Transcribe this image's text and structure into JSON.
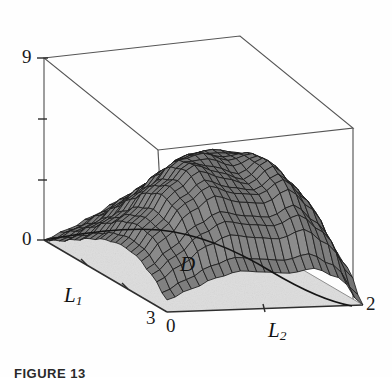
{
  "figure": {
    "caption": "FIGURE 13",
    "region_label": "D",
    "background_color": "#fefefe"
  },
  "axes": {
    "vertical": {
      "label": "",
      "min_label": "0",
      "max_label": "9",
      "range": [
        0,
        9
      ],
      "ticks": [
        0,
        3,
        6,
        9
      ],
      "tick_labels": [
        "0",
        "",
        "",
        "9"
      ]
    },
    "l1": {
      "name": "L",
      "subscript": "1",
      "start_label": "0",
      "end_label": "3",
      "range": [
        0,
        3
      ],
      "ticks": [
        0,
        1,
        2,
        3
      ]
    },
    "l2": {
      "name": "L",
      "subscript": "2",
      "start_label": "0",
      "end_label": "2",
      "range": [
        0,
        2
      ],
      "ticks": [
        0,
        1,
        2
      ]
    }
  },
  "colors": {
    "surface_fill": "#6e6e6e",
    "surface_fill_light": "#9a9a9a",
    "surface_mesh": "#1c1c1c",
    "base_plane": "#dddddd",
    "base_edge": "#3a3a3a",
    "box_wire": "#4a4a4a",
    "text": "#1a1a1a"
  },
  "chart_data": {
    "type": "surface",
    "title": "",
    "xlabel": "L_2",
    "ylabel": "L_1",
    "zlabel": "",
    "xlim": [
      0,
      2
    ],
    "ylim": [
      0,
      3
    ],
    "zlim": [
      0,
      9
    ],
    "grid": false,
    "legend": "none",
    "x": [
      0,
      0.25,
      0.5,
      0.75,
      1,
      1.25,
      1.5,
      1.75,
      2
    ],
    "y": [
      0,
      0.375,
      0.75,
      1.125,
      1.5,
      1.875,
      2.25,
      2.625,
      3
    ],
    "z": [
      [
        0.0,
        0.5,
        1.1,
        1.8,
        2.4,
        2.9,
        3.1,
        2.6,
        1.4
      ],
      [
        0.4,
        1.0,
        1.8,
        2.6,
        3.3,
        3.8,
        3.9,
        3.2,
        1.8
      ],
      [
        0.9,
        1.7,
        2.7,
        3.6,
        4.4,
        4.8,
        4.8,
        3.9,
        2.1
      ],
      [
        1.4,
        2.4,
        3.6,
        4.7,
        5.4,
        5.6,
        5.4,
        4.3,
        2.3
      ],
      [
        1.8,
        3.0,
        4.4,
        5.6,
        5.9,
        5.5,
        5.8,
        4.6,
        2.4
      ],
      [
        2.0,
        3.3,
        4.8,
        5.8,
        5.4,
        5.0,
        5.9,
        4.7,
        2.3
      ],
      [
        1.9,
        3.1,
        4.4,
        5.2,
        4.8,
        4.7,
        5.4,
        4.3,
        2.0
      ],
      [
        1.4,
        2.3,
        3.3,
        3.9,
        3.7,
        3.6,
        4.1,
        3.2,
        1.4
      ],
      [
        0.6,
        1.1,
        1.6,
        1.9,
        1.8,
        1.7,
        1.9,
        1.4,
        0.0
      ]
    ],
    "series": [
      {
        "name": "surface",
        "peaks": [
          {
            "label": "left-ridge-peak",
            "x": 1.0,
            "y": 1.9,
            "z": 5.9
          },
          {
            "label": "right-ridge-peak",
            "x": 1.5,
            "y": 1.85,
            "z": 6.0
          }
        ],
        "saddle": {
          "x": 1.25,
          "y": 1.9,
          "z": 4.9
        },
        "zeros": [
          {
            "x": 0,
            "y": 0,
            "z": 0
          },
          {
            "x": 2,
            "y": 3,
            "z": 0
          }
        ]
      }
    ]
  }
}
